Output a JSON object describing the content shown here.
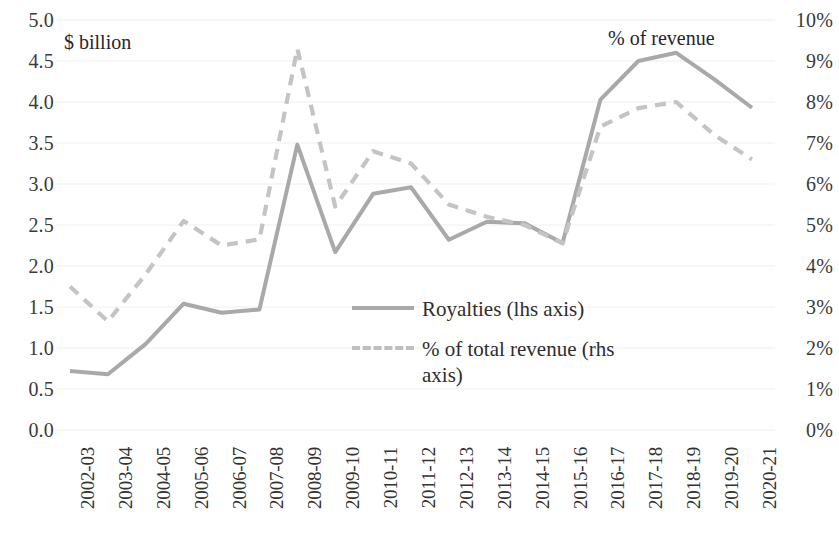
{
  "chart_data": {
    "type": "line",
    "title": "",
    "subtitle": "",
    "xlabel": "",
    "ylabel": "$ billion",
    "y2label": "% of revenue",
    "grid": true,
    "legend_position": "center",
    "categories": [
      "2002-03",
      "2003-04",
      "2004-05",
      "2005-06",
      "2006-07",
      "2007-08",
      "2008-09",
      "2009-10",
      "2010-11",
      "2011-12",
      "2012-13",
      "2013-14",
      "2014-15",
      "2015-16",
      "2016-17",
      "2017-18",
      "2018-19",
      "2019-20",
      "2020-21"
    ],
    "series": [
      {
        "name": "Royalties (lhs axis)",
        "axis": "left",
        "style": "solid",
        "color": "#a9a9a9",
        "unit": "$ billion",
        "values": [
          0.72,
          0.68,
          1.05,
          1.54,
          1.43,
          1.47,
          3.48,
          2.17,
          2.88,
          2.96,
          2.32,
          2.54,
          2.52,
          2.28,
          4.03,
          4.5,
          4.6,
          4.28,
          3.93
        ]
      },
      {
        "name": "% of total revenue (rhs axis)",
        "axis": "right",
        "style": "dashed",
        "color": "#c4c4c4",
        "unit": "%",
        "values": [
          3.5,
          2.65,
          3.8,
          5.1,
          4.5,
          4.65,
          9.3,
          5.45,
          6.8,
          6.5,
          5.5,
          5.2,
          5.0,
          4.55,
          7.4,
          7.85,
          8.0,
          7.2,
          6.6
        ]
      }
    ],
    "ylim": [
      0,
      5
    ],
    "yticks": [
      0.0,
      0.5,
      1.0,
      1.5,
      2.0,
      2.5,
      3.0,
      3.5,
      4.0,
      4.5,
      5.0
    ],
    "ytick_labels": [
      "0.0",
      "0.5",
      "1.0",
      "1.5",
      "2.0",
      "2.5",
      "3.0",
      "3.5",
      "4.0",
      "4.5",
      "5.0"
    ],
    "y2lim": [
      0,
      10
    ],
    "y2ticks": [
      0,
      1,
      2,
      3,
      4,
      5,
      6,
      7,
      8,
      9,
      10
    ],
    "y2tick_labels": [
      "0%",
      "1%",
      "2%",
      "3%",
      "4%",
      "5%",
      "6%",
      "7%",
      "8%",
      "9%",
      "10%"
    ]
  },
  "legend": {
    "items": [
      {
        "label": "Royalties (lhs axis)",
        "style": "solid"
      },
      {
        "label": "% of total revenue (rhs axis)",
        "style": "dashed"
      }
    ]
  },
  "colors": {
    "series_solid": "#a9a9a9",
    "series_dashed": "#c4c4c4",
    "gridline": "#efefef",
    "text": "#2b2b2b",
    "background": "#ffffff"
  }
}
